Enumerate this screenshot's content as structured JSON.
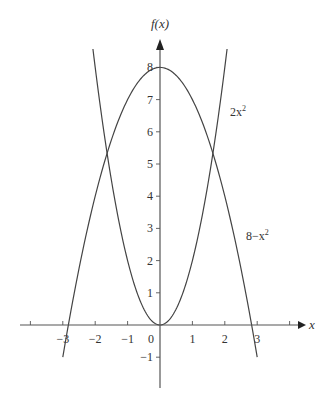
{
  "chart_data": {
    "type": "line",
    "title": "",
    "xlabel": "x",
    "ylabel": "f(x)",
    "xlim": [
      -4.3,
      4.4
    ],
    "ylim": [
      -1.9,
      8.9
    ],
    "grid": false,
    "legend_position": "inline",
    "x_ticks": [
      -4,
      -3,
      -2,
      -1,
      0,
      1,
      2,
      3,
      4
    ],
    "x_tick_labels": [
      "",
      "−3",
      "−2",
      "−1",
      "0",
      "1",
      "2",
      "3",
      ""
    ],
    "y_ticks": [
      -1,
      1,
      2,
      3,
      4,
      5,
      6,
      7,
      8
    ],
    "y_tick_labels": [
      "−1",
      "1",
      "2",
      "3",
      "4",
      "5",
      "6",
      "7",
      "8"
    ],
    "series": [
      {
        "name": "2x²",
        "label_text": "2x",
        "label_sup": "2",
        "formula": "2*x^2",
        "domain": [
          -2.07,
          2.07
        ],
        "x": [
          -2.07,
          -2,
          -1.5,
          -1,
          -0.5,
          0,
          0.5,
          1,
          1.5,
          2,
          2.07
        ],
        "values": [
          8.57,
          8,
          4.5,
          2,
          0.5,
          0,
          0.5,
          2,
          4.5,
          8,
          8.57
        ]
      },
      {
        "name": "8−x²",
        "label_text": "8−x",
        "label_sup": "2",
        "formula": "8-x^2",
        "domain": [
          -3,
          3
        ],
        "x": [
          -3,
          -2.5,
          -2,
          -1.5,
          -1,
          -0.5,
          0,
          0.5,
          1,
          1.5,
          2,
          2.5,
          3
        ],
        "values": [
          -1,
          1.75,
          4,
          5.75,
          7,
          7.75,
          8,
          7.75,
          7,
          5.75,
          4,
          1.75,
          -1
        ]
      }
    ],
    "annotations": [
      {
        "text": "2x²",
        "x": 2.2,
        "y": 6.6
      },
      {
        "text": "8−x²",
        "x": 2.65,
        "y": 2.8
      }
    ]
  },
  "labels": {
    "y_axis": "f(x)",
    "x_axis": "x",
    "curve1_base": "2x",
    "curve1_sup": "2",
    "curve2_base": "8−x",
    "curve2_sup": "2"
  }
}
